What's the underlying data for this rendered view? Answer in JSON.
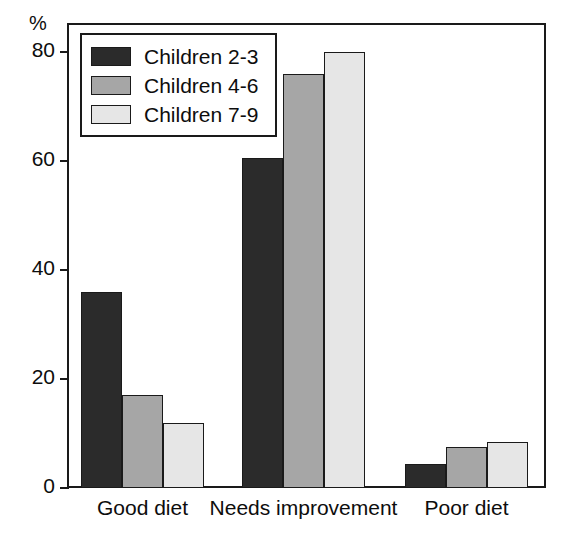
{
  "chart_data": {
    "type": "bar",
    "title": "",
    "subtitle": "",
    "xlabel": "",
    "ylabel": "%",
    "ylim": [
      0,
      85
    ],
    "yticks": [
      0,
      20,
      40,
      60,
      80
    ],
    "ytick_labels": [
      "0",
      "20",
      "40",
      "60",
      "80"
    ],
    "grid": false,
    "legend_position": "top-left",
    "categories": [
      "Good diet",
      "Needs improvement",
      "Poor diet"
    ],
    "series": [
      {
        "name": "Children 2-3",
        "color": "#2b2b2b",
        "values": [
          36,
          60.5,
          4.5
        ]
      },
      {
        "name": "Children 4-6",
        "color": "#a6a6a6",
        "values": [
          17,
          76,
          7.5
        ]
      },
      {
        "name": "Children 7-9",
        "color": "#e6e6e6",
        "values": [
          12,
          80,
          8.5
        ]
      }
    ]
  },
  "axis": {
    "y_title": "%"
  },
  "legend": {
    "entries": [
      {
        "label": "Children 2-3"
      },
      {
        "label": "Children 4-6"
      },
      {
        "label": "Children 7-9"
      }
    ]
  }
}
